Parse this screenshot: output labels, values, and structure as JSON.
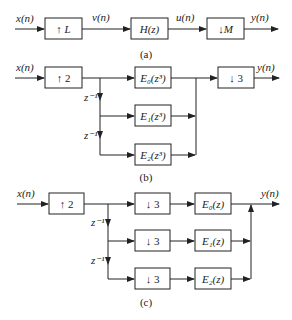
{
  "diagram_a": {
    "caption": "(a)",
    "input_label": "x(n)",
    "block1": "↑ L",
    "signal1": "v(n)",
    "block2": "H(z)",
    "signal2": "u(n)",
    "block3": "↓M",
    "output_label": "y(n)"
  },
  "diagram_b": {
    "caption": "(b)",
    "input_label": "x(n)",
    "upsampler": "↑ 2",
    "delay1": "z⁻¹",
    "delay2": "z⁻¹",
    "filters": [
      "E₀(z³)",
      "E₁(z³)",
      "E₂(z³)"
    ],
    "downsampler": "↓ 3",
    "output_label": "y(n)"
  },
  "diagram_c": {
    "caption": "(c)",
    "input_label": "x(n)",
    "upsampler": "↑ 2",
    "delay1": "z⁻¹",
    "delay2": "z⁻¹",
    "downsamplers": [
      "↓ 3",
      "↓ 3",
      "↓ 3"
    ],
    "filters": [
      "E₀(z)",
      "E₁(z)",
      "E₂(z)"
    ],
    "output_label": "y(n)"
  }
}
